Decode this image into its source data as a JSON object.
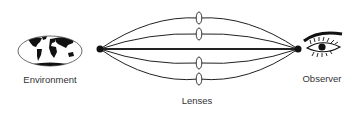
{
  "diagram": {
    "labels": {
      "environment": "Environment",
      "observer": "Observer",
      "lenses": "Lenses"
    },
    "colors": {
      "line": "#222222",
      "text": "#333333",
      "background": "#ffffff"
    },
    "nodes": [
      {
        "id": "environment",
        "icon": "globe-icon"
      },
      {
        "id": "observer",
        "icon": "eye-icon"
      }
    ],
    "lens_count": 4,
    "path_count": 5
  }
}
